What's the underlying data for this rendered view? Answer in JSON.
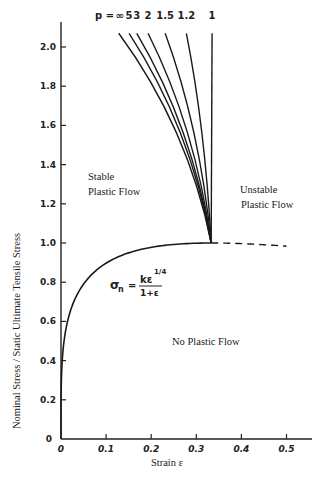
{
  "chart_data": {
    "type": "line",
    "title": "",
    "xlabel": "Strain ε",
    "ylabel": "Nominal Stress / Static Ultimate Tensile Stress",
    "xlim": [
      0,
      0.555
    ],
    "ylim": [
      0,
      2.1
    ],
    "grid": false,
    "x_ticks": [
      "0",
      "0.1",
      "0.2",
      "0.3",
      "0.4",
      "0.5"
    ],
    "y_ticks": [
      "0",
      "0.2",
      "0.4",
      "0.6",
      "0.8",
      "1.0",
      "1.2",
      "1.4",
      "1.6",
      "1.8",
      "2.0"
    ],
    "main_curve": {
      "name": "σn = kε^(1/4)/(1+ε)",
      "formula": {
        "lhs": "σn",
        "numerator": "kε",
        "exponent": "1/4",
        "denominator": "1+ε"
      },
      "solid_range": [
        0,
        0.333
      ],
      "dashed_range": [
        0.333,
        0.5
      ],
      "peak": {
        "x": 0.333,
        "y": 1.0
      },
      "sample_points": [
        {
          "x": 0.0,
          "y": 0.0
        },
        {
          "x": 0.005,
          "y": 0.46
        },
        {
          "x": 0.02,
          "y": 0.65
        },
        {
          "x": 0.05,
          "y": 0.79
        },
        {
          "x": 0.1,
          "y": 0.89
        },
        {
          "x": 0.15,
          "y": 0.95
        },
        {
          "x": 0.2,
          "y": 0.98
        },
        {
          "x": 0.25,
          "y": 0.99
        },
        {
          "x": 0.333,
          "y": 1.0
        },
        {
          "x": 0.4,
          "y": 0.99
        },
        {
          "x": 0.5,
          "y": 0.98
        }
      ]
    },
    "series": [
      {
        "name": "p = ∞",
        "label": "∞",
        "start": {
          "x": 0.333,
          "y": 1.0
        },
        "end": {
          "x": 0.128,
          "y": 2.07
        }
      },
      {
        "name": "p = 5",
        "label": "5",
        "start": {
          "x": 0.333,
          "y": 1.0
        },
        "end": {
          "x": 0.151,
          "y": 2.07
        }
      },
      {
        "name": "p = 3",
        "label": "3",
        "start": {
          "x": 0.333,
          "y": 1.0
        },
        "end": {
          "x": 0.168,
          "y": 2.07
        }
      },
      {
        "name": "p = 2",
        "label": "2",
        "start": {
          "x": 0.333,
          "y": 1.0
        },
        "end": {
          "x": 0.193,
          "y": 2.07
        }
      },
      {
        "name": "p = 1.5",
        "label": "1.5",
        "start": {
          "x": 0.333,
          "y": 1.0
        },
        "end": {
          "x": 0.231,
          "y": 2.07
        }
      },
      {
        "name": "p = 1.2",
        "label": "1.2",
        "start": {
          "x": 0.333,
          "y": 1.0
        },
        "end": {
          "x": 0.278,
          "y": 2.07
        }
      },
      {
        "name": "p = 1",
        "label": "1",
        "start": {
          "x": 0.333,
          "y": 1.0
        },
        "end": {
          "x": 0.335,
          "y": 2.07
        }
      }
    ],
    "annotations": [
      {
        "text": "Stable",
        "x": 0.03,
        "y": 1.42
      },
      {
        "text": "Plastic Flow",
        "x": 0.03,
        "y": 1.35
      },
      {
        "text": "Unstable",
        "x": 0.375,
        "y": 1.27
      },
      {
        "text": "Plastic Flow",
        "x": 0.375,
        "y": 1.2
      },
      {
        "text": "No Plastic Flow",
        "x": 0.205,
        "y": 0.45
      }
    ],
    "legend_prefix": "p ="
  },
  "labels": {
    "ylabel": "Nominal Stress / Static Ultimate Tensile Stress",
    "xlabel": "Strain ε",
    "p_prefix": "p =",
    "stable_1": "Stable",
    "stable_2": "Plastic Flow",
    "unstable_1": "Unstable",
    "unstable_2": "Plastic Flow",
    "no_flow": "No Plastic Flow",
    "formula_lhs": "σ",
    "formula_sub": "n",
    "formula_eq": "=",
    "formula_num": "kε",
    "formula_exp": "1/4",
    "formula_den": "1+ε"
  }
}
